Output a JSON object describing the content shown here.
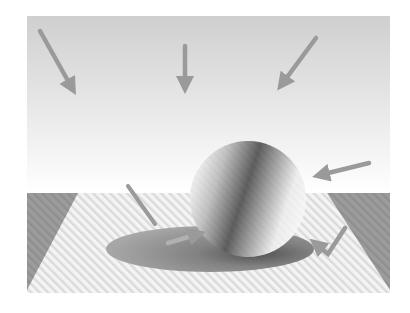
{
  "figure": {
    "background_color": "#ffffff",
    "sky": {
      "top_color": "#cfcfcf",
      "bottom_color": "#ffffff"
    },
    "floor": {
      "base_color": "#f2f2f2",
      "stripe_color": "#dcdcdc",
      "side_wedge_color": "#9a9a9a"
    },
    "sphere": {
      "highlight_color": "#f4f4f4",
      "core_shadow_color": "#3c3c3c",
      "rim_color": "#e6e6e6"
    },
    "shadow_color": "#8e8e8e",
    "arrow_color": "#9a9a9a",
    "arrows": [
      {
        "name": "light-arrow-top-left",
        "x1": 40,
        "y1": 31,
        "x2": 76,
        "y2": 95
      },
      {
        "name": "light-arrow-top-center",
        "x1": 185,
        "y1": 46,
        "x2": 185,
        "y2": 93
      },
      {
        "name": "light-arrow-top-right",
        "x1": 316,
        "y1": 38,
        "x2": 277,
        "y2": 91
      },
      {
        "name": "light-arrow-right",
        "x1": 369,
        "y1": 163,
        "x2": 313,
        "y2": 177
      },
      {
        "name": "reflected-light-arrow",
        "x1": 345,
        "y1": 228,
        "x2": 311,
        "y2": 239
      },
      {
        "name": "shadow-direction-arrow",
        "x1": 165,
        "y1": 244,
        "x2": 203,
        "y2": 232
      },
      {
        "name": "shadow-stick",
        "x1": 128,
        "y1": 186,
        "x2": 155,
        "y2": 224
      }
    ]
  }
}
